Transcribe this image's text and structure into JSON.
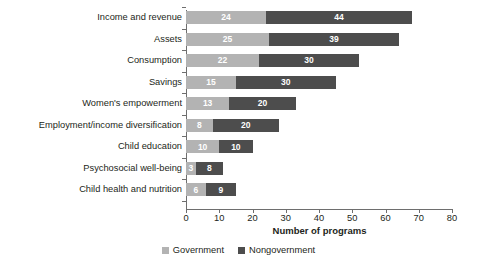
{
  "chart_data": {
    "type": "bar",
    "orientation": "horizontal",
    "stacked": true,
    "title": "",
    "xlabel": "Number of programs",
    "ylabel": "",
    "xlim": [
      0,
      80
    ],
    "xticks": [
      0,
      10,
      20,
      30,
      40,
      50,
      60,
      70,
      80
    ],
    "grid": false,
    "legend_position": "bottom-center",
    "categories": [
      "Income and revenue",
      "Assets",
      "Consumption",
      "Savings",
      "Women's empowerment",
      "Employment/income diversification",
      "Child education",
      "Psychosocial well-being",
      "Child health and nutrition"
    ],
    "series": [
      {
        "name": "Government",
        "color": "#b3b3b3",
        "values": [
          24,
          25,
          22,
          15,
          13,
          8,
          10,
          3,
          6
        ]
      },
      {
        "name": "Nongovernment",
        "color": "#4d4d4d",
        "values": [
          44,
          39,
          30,
          30,
          20,
          20,
          10,
          8,
          9
        ]
      }
    ],
    "totals": [
      68,
      64,
      52,
      45,
      33,
      28,
      20,
      11,
      15
    ]
  },
  "legend": {
    "items": [
      {
        "label": "Government",
        "color": "#b3b3b3"
      },
      {
        "label": "Nongovernment",
        "color": "#4d4d4d"
      }
    ]
  }
}
